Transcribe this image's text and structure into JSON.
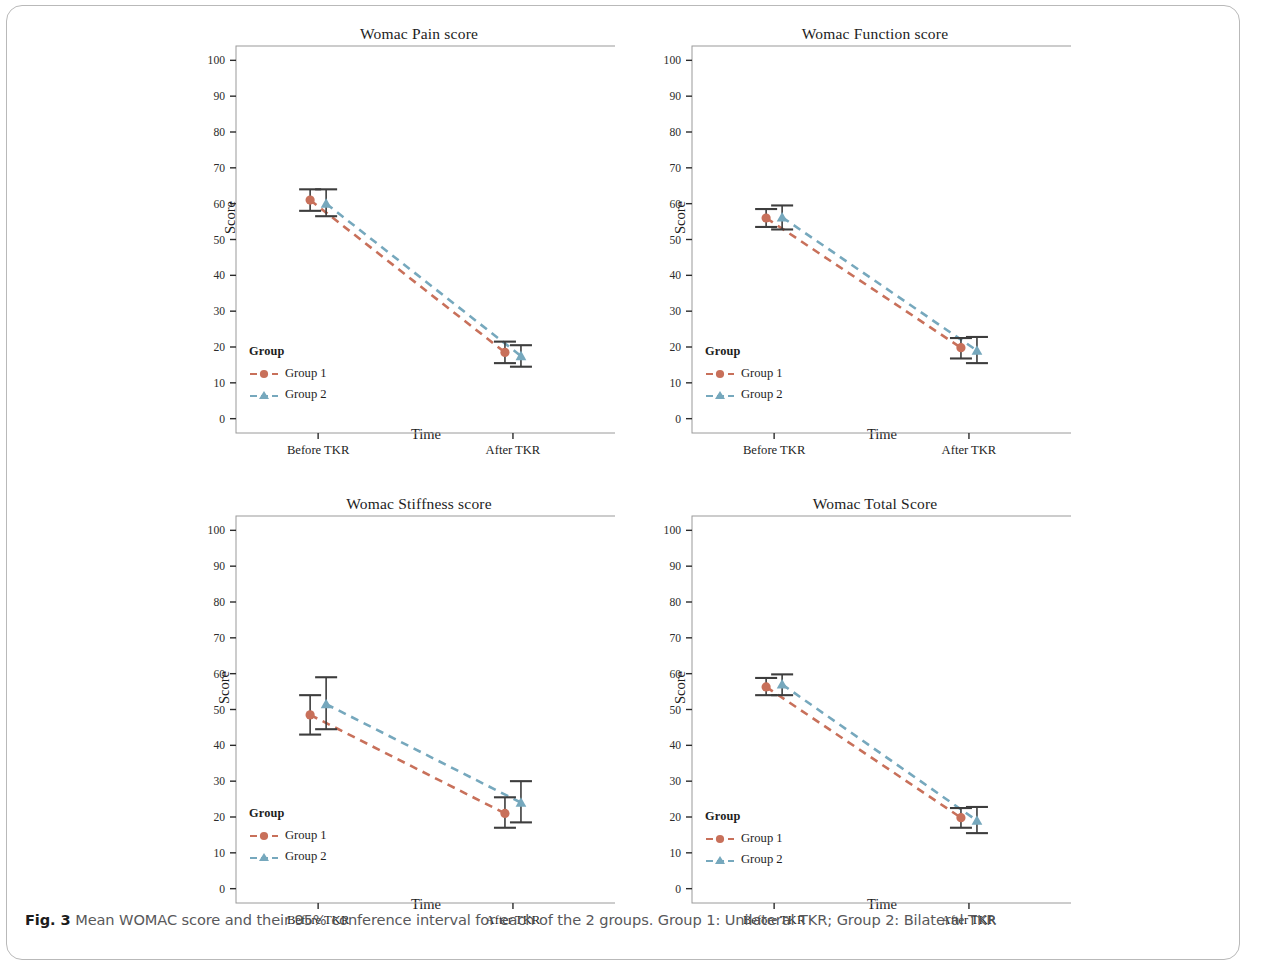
{
  "figure": {
    "caption_bold": "Fig. 3",
    "caption_text": " Mean WOMAC score and their 95% conference interval for each of the 2 groups. Group 1: Unilateral TKR; Group 2: Bilateral TKR"
  },
  "colors": {
    "group1": "#c8705a",
    "group2": "#76a8bd",
    "errorbar": "#3d3d3d",
    "frame": "#9a9a9a",
    "text": "#1d1d1d"
  },
  "legend": {
    "title": "Group",
    "items": [
      {
        "label": "Group 1",
        "marker": "circle",
        "color": "#c8705a"
      },
      {
        "label": "Group 2",
        "marker": "triangle",
        "color": "#76a8bd"
      }
    ]
  },
  "axes": {
    "ylabel": "Score",
    "xlabel": "Time",
    "yticks": [
      0,
      10,
      20,
      30,
      40,
      50,
      60,
      70,
      80,
      90,
      100
    ],
    "ylim": [
      -4,
      104
    ],
    "xticks": [
      "Before TKR",
      "After TKR"
    ]
  },
  "chart_data": [
    {
      "type": "line",
      "title": "Womac Pain score",
      "xlabel": "Time",
      "ylabel": "Score",
      "categories": [
        "Before TKR",
        "After TKR"
      ],
      "ylim": [
        0,
        100
      ],
      "grid": false,
      "legend_position": "lower-left",
      "series": [
        {
          "name": "Group 1",
          "color": "#c8705a",
          "marker": "circle",
          "values": [
            61,
            18.5
          ],
          "ci_low": [
            58,
            15.5
          ],
          "ci_high": [
            64,
            21.5
          ]
        },
        {
          "name": "Group 2",
          "color": "#76a8bd",
          "marker": "triangle",
          "values": [
            60,
            17.5
          ],
          "ci_low": [
            56.5,
            14.5
          ],
          "ci_high": [
            64,
            20.5
          ]
        }
      ]
    },
    {
      "type": "line",
      "title": "Womac Function score",
      "xlabel": "Time",
      "ylabel": "Score",
      "categories": [
        "Before TKR",
        "After TKR"
      ],
      "ylim": [
        0,
        100
      ],
      "grid": false,
      "legend_position": "lower-left",
      "series": [
        {
          "name": "Group 1",
          "color": "#c8705a",
          "marker": "circle",
          "values": [
            56,
            19.8
          ],
          "ci_low": [
            53.5,
            16.8
          ],
          "ci_high": [
            58.5,
            22.5
          ]
        },
        {
          "name": "Group 2",
          "color": "#76a8bd",
          "marker": "triangle",
          "values": [
            56.2,
            19
          ],
          "ci_low": [
            52.8,
            15.5
          ],
          "ci_high": [
            59.5,
            22.8
          ]
        }
      ]
    },
    {
      "type": "line",
      "title": "Womac Stiffness score",
      "xlabel": "Time",
      "ylabel": "Score",
      "categories": [
        "Before TKR",
        "After TKR"
      ],
      "ylim": [
        0,
        100
      ],
      "grid": false,
      "legend_position": "lower-left",
      "series": [
        {
          "name": "Group 1",
          "color": "#c8705a",
          "marker": "circle",
          "values": [
            48.5,
            21
          ],
          "ci_low": [
            43,
            17
          ],
          "ci_high": [
            54,
            25.5
          ]
        },
        {
          "name": "Group 2",
          "color": "#76a8bd",
          "marker": "triangle",
          "values": [
            51.5,
            24
          ],
          "ci_low": [
            44.5,
            18.5
          ],
          "ci_high": [
            59,
            30
          ]
        }
      ]
    },
    {
      "type": "line",
      "title": "Womac Total Score",
      "xlabel": "Time",
      "ylabel": "Score",
      "categories": [
        "Before TKR",
        "After TKR"
      ],
      "ylim": [
        0,
        100
      ],
      "grid": false,
      "legend_position": "lower-left",
      "series": [
        {
          "name": "Group 1",
          "color": "#c8705a",
          "marker": "circle",
          "values": [
            56.3,
            19.8
          ],
          "ci_low": [
            54,
            17
          ],
          "ci_high": [
            58.8,
            22.5
          ]
        },
        {
          "name": "Group 2",
          "color": "#76a8bd",
          "marker": "triangle",
          "values": [
            57,
            19
          ],
          "ci_low": [
            54,
            15.5
          ],
          "ci_high": [
            59.8,
            22.8
          ]
        }
      ]
    }
  ]
}
